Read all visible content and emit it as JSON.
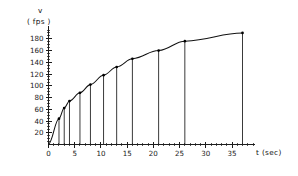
{
  "chart_data": {
    "type": "line",
    "title": "",
    "subtitle": "",
    "xlabel": "t (sec)",
    "ylabel": "v (fps)",
    "ylabel_line1": "v",
    "ylabel_line2": "( fps )",
    "grid": false,
    "legend": false,
    "legend_position": "none",
    "xlim": [
      0,
      39
    ],
    "ylim": [
      0,
      195
    ],
    "x_ticks": [
      0,
      5,
      10,
      15,
      20,
      25,
      30,
      35
    ],
    "x_tick_labels": [
      "0",
      "5",
      "10",
      "15",
      "20",
      "25",
      "30",
      "35"
    ],
    "x_minor_step": 1,
    "y_ticks": [
      20,
      40,
      60,
      80,
      100,
      120,
      140,
      160,
      180
    ],
    "y_tick_labels": [
      "20",
      "40",
      "60",
      "80",
      "100",
      "120",
      "140",
      "160",
      "180"
    ],
    "y_minor_step": 5,
    "series": [
      {
        "name": "velocity",
        "marker": "dot",
        "drop_lines": true,
        "x": [
          0,
          2,
          3,
          4,
          6,
          8,
          10.5,
          13,
          16,
          21,
          26,
          37
        ],
        "y": [
          0,
          44,
          62,
          74,
          88,
          102,
          118,
          132,
          146,
          160,
          176,
          190
        ]
      }
    ],
    "points": [
      {
        "t": 0,
        "v": 0
      },
      {
        "t": 2,
        "v": 44
      },
      {
        "t": 3,
        "v": 62
      },
      {
        "t": 4,
        "v": 74
      },
      {
        "t": 6,
        "v": 88
      },
      {
        "t": 8,
        "v": 102
      },
      {
        "t": 10.5,
        "v": 118
      },
      {
        "t": 13,
        "v": 132
      },
      {
        "t": 16,
        "v": 146
      },
      {
        "t": 21,
        "v": 160
      },
      {
        "t": 26,
        "v": 176
      },
      {
        "t": 37,
        "v": 190
      }
    ],
    "colors": {
      "curve": "#111111",
      "axis": "#1c1c1c",
      "drop_line": "#242424",
      "marker": "#000000",
      "background": "#ffffff"
    }
  }
}
